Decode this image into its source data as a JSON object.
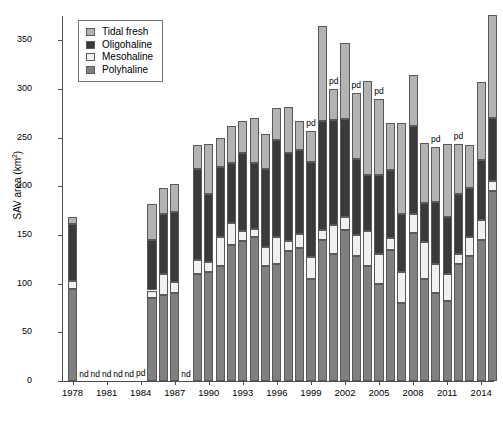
{
  "chart_data": {
    "type": "bar",
    "subtype": "stacked-bar",
    "title": "",
    "xlabel": "",
    "ylabel": "SAV area (km2)",
    "ylabel_display": "SAV area (km",
    "ylabel_sup": "2",
    "ylabel_tail": ")",
    "ylim": [
      0,
      375
    ],
    "yticks": [
      0,
      50,
      100,
      150,
      200,
      250,
      300,
      350
    ],
    "xticks": [
      1978,
      1981,
      1984,
      1987,
      1990,
      1993,
      1996,
      1999,
      2002,
      2005,
      2008,
      2011,
      2014
    ],
    "grid": false,
    "legend_position": "top-left",
    "legend": [
      "Tidal fresh",
      "Oligohaline",
      "Mesohaline",
      "Polyhaline"
    ],
    "series_order": [
      "Polyhaline",
      "Mesohaline",
      "Oligohaline",
      "Tidal fresh"
    ],
    "colors": {
      "Tidal fresh": "#b3b3b3",
      "Oligohaline": "#3a3a3a",
      "Mesohaline": "#f0f0f0",
      "Polyhaline": "#808080"
    },
    "categories": [
      1978,
      1979,
      1980,
      1981,
      1982,
      1983,
      1984,
      1985,
      1986,
      1987,
      1988,
      1989,
      1990,
      1991,
      1992,
      1993,
      1994,
      1995,
      1996,
      1997,
      1998,
      1999,
      2000,
      2001,
      2002,
      2003,
      2004,
      2005,
      2006,
      2007,
      2008,
      2009,
      2010,
      2011,
      2012,
      2013,
      2014,
      2015
    ],
    "no_data_years": [
      1979,
      1980,
      1981,
      1982,
      1983,
      1988
    ],
    "partial_data_years": [
      1984,
      1999,
      2001,
      2003,
      2005,
      2010,
      2012
    ],
    "series": [
      {
        "name": "Polyhaline",
        "values": [
          95,
          0,
          0,
          0,
          0,
          0,
          0,
          85,
          88,
          90,
          0,
          110,
          112,
          118,
          140,
          144,
          148,
          118,
          120,
          134,
          137,
          105,
          145,
          130,
          155,
          128,
          118,
          100,
          135,
          80,
          152,
          105,
          90,
          82,
          120,
          128,
          145,
          195
        ]
      },
      {
        "name": "Mesohaline",
        "values": [
          8,
          0,
          0,
          0,
          0,
          0,
          0,
          8,
          22,
          12,
          0,
          14,
          10,
          30,
          22,
          10,
          8,
          20,
          28,
          10,
          14,
          22,
          10,
          30,
          14,
          22,
          36,
          30,
          12,
          32,
          20,
          38,
          30,
          28,
          10,
          20,
          20,
          10
        ]
      },
      {
        "name": "Oligohaline",
        "values": [
          58,
          0,
          0,
          0,
          0,
          0,
          0,
          52,
          62,
          72,
          0,
          94,
          70,
          72,
          62,
          80,
          68,
          80,
          100,
          90,
          86,
          98,
          112,
          108,
          100,
          78,
          58,
          82,
          70,
          60,
          90,
          40,
          64,
          58,
          62,
          50,
          62,
          65
        ]
      },
      {
        "name": "Tidal fresh",
        "values": [
          7,
          0,
          0,
          0,
          0,
          0,
          0,
          37,
          26,
          28,
          0,
          24,
          52,
          30,
          38,
          33,
          46,
          36,
          32,
          48,
          30,
          32,
          98,
          32,
          78,
          68,
          96,
          78,
          48,
          93,
          52,
          62,
          56,
          76,
          52,
          44,
          80,
          106
        ]
      }
    ],
    "totals": [
      168,
      0,
      0,
      0,
      0,
      0,
      0,
      182,
      198,
      202,
      0,
      242,
      244,
      250,
      262,
      267,
      270,
      254,
      280,
      282,
      267,
      257,
      365,
      300,
      347,
      296,
      308,
      290,
      265,
      265,
      314,
      245,
      240,
      244,
      244,
      242,
      307,
      376
    ],
    "nd_marker_text": "nd",
    "pd_marker_text": "pd"
  }
}
